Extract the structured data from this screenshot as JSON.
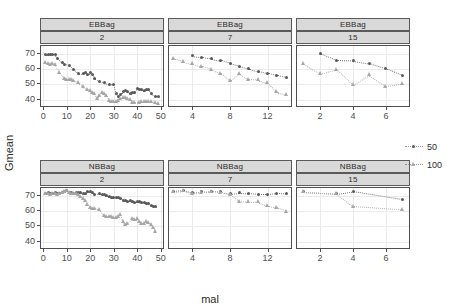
{
  "chart_data": {
    "type": "scatter",
    "title": "",
    "xlabel": "mal",
    "ylabel": "Gmean",
    "ylim": [
      36,
      75
    ],
    "yticks": [
      40,
      50,
      60,
      70
    ],
    "grid": true,
    "legend": {
      "position": "right",
      "entries": [
        {
          "label": "50",
          "marker": "circle",
          "color": "#595959"
        },
        {
          "label": "100",
          "marker": "triangle",
          "color": "#a6a6a6"
        }
      ]
    },
    "facets": {
      "row_labels": [
        "EBBag",
        "NBBag"
      ],
      "col_labels": [
        "2",
        "7",
        "15"
      ]
    },
    "panels": [
      {
        "row": "EBBag",
        "col": "2",
        "xlim": [
          -1,
          51
        ],
        "xticks": [
          0,
          10,
          20,
          30,
          40,
          50
        ],
        "series": [
          {
            "name": "50",
            "marker": "circle",
            "x": [
              1,
              2,
              3,
              4,
              5,
              6,
              8,
              9,
              11,
              13,
              15,
              17,
              18,
              19,
              20,
              21,
              22,
              24,
              26,
              28,
              30,
              31,
              32,
              33,
              34,
              35,
              36,
              37,
              38,
              39,
              40,
              41,
              42,
              43,
              44,
              45,
              46,
              48,
              49
            ],
            "y": [
              69.2,
              69.6,
              69.8,
              69.5,
              69.8,
              67.0,
              64.5,
              63.0,
              62.5,
              60.0,
              57.0,
              57.3,
              57.5,
              56.2,
              58.0,
              56.5,
              54.0,
              52.0,
              51.0,
              50.2,
              50.0,
              44.0,
              42.5,
              43.8,
              45.5,
              46.0,
              45.2,
              44.0,
              44.5,
              45.0,
              47.5,
              47.0,
              46.5,
              46.0,
              47.0,
              46.8,
              44.0,
              42.5,
              42.5
            ]
          },
          {
            "name": "100",
            "marker": "triangle",
            "x": [
              1,
              2,
              3,
              4,
              5,
              7,
              9,
              10,
              11,
              12,
              13,
              15,
              17,
              19,
              20,
              21,
              22,
              23,
              24,
              25,
              26,
              27,
              28,
              29,
              30,
              31,
              32,
              33,
              34,
              35,
              36,
              37,
              38,
              39,
              41,
              42,
              43,
              44,
              45,
              46,
              48,
              49
            ],
            "y": [
              64.0,
              63.5,
              63.2,
              63.8,
              63.0,
              58.0,
              54.0,
              53.5,
              53.5,
              53.0,
              52.8,
              51.0,
              48.5,
              47.0,
              46.0,
              45.0,
              44.0,
              41.0,
              43.0,
              44.5,
              44.0,
              43.0,
              39.5,
              39.0,
              39.2,
              39.0,
              39.5,
              41.0,
              41.5,
              41.5,
              41.0,
              40.0,
              38.5,
              38.5,
              38.5,
              38.8,
              39.0,
              39.0,
              38.8,
              39.0,
              38.0,
              37.8
            ]
          }
        ]
      },
      {
        "row": "EBBag",
        "col": "7",
        "xlim": [
          1.5,
          14.5
        ],
        "xticks": [
          4,
          8,
          12
        ],
        "series": [
          {
            "name": "50",
            "marker": "circle",
            "x": [
              4,
              5,
              6,
              7,
              8,
              9,
              10,
              11,
              12,
              13,
              14
            ],
            "y": [
              68.6,
              67.8,
              66.8,
              65.6,
              63.8,
              62.0,
              60.3,
              58.6,
              57.3,
              56.0,
              54.8
            ]
          },
          {
            "name": "100",
            "marker": "triangle",
            "x": [
              2,
              3,
              4,
              5,
              6,
              7,
              8,
              9,
              10,
              11,
              12,
              13,
              14
            ],
            "y": [
              67.0,
              64.8,
              63.4,
              61.8,
              60.0,
              57.2,
              52.4,
              57.0,
              53.5,
              53.2,
              51.0,
              45.4,
              43.4
            ]
          }
        ]
      },
      {
        "row": "EBBag",
        "col": "15",
        "xlim": [
          0.6,
          7.4
        ],
        "xticks": [
          2,
          4,
          6
        ],
        "series": [
          {
            "name": "50",
            "marker": "circle",
            "x": [
              2,
              3,
              4,
              5,
              6,
              7
            ],
            "y": [
              70.2,
              65.8,
              65.5,
              63.8,
              60.5,
              56.0
            ]
          },
          {
            "name": "100",
            "marker": "triangle",
            "x": [
              1,
              2,
              3,
              4,
              5,
              6,
              7
            ],
            "y": [
              63.4,
              57.0,
              60.0,
              49.8,
              56.2,
              49.0,
              50.5
            ]
          }
        ]
      },
      {
        "row": "NBBag",
        "col": "2",
        "xlim": [
          -1,
          51
        ],
        "xticks": [
          0,
          10,
          20,
          30,
          40,
          50
        ],
        "series": [
          {
            "name": "50",
            "marker": "circle",
            "x": [
              1,
              2,
              3,
              4,
              5,
              6,
              7,
              8,
              9,
              10,
              11,
              12,
              13,
              14,
              15,
              16,
              17,
              18,
              19,
              20,
              21,
              22,
              24,
              25,
              26,
              27,
              28,
              29,
              30,
              31,
              32,
              33,
              34,
              35,
              36,
              37,
              38,
              39,
              40,
              41,
              42,
              43,
              44,
              45,
              46,
              47,
              48
            ],
            "y": [
              71.6,
              71.8,
              71.2,
              71.5,
              71.8,
              71.2,
              71.5,
              72.2,
              72.8,
              73.2,
              72.4,
              71.8,
              71.5,
              72.0,
              71.8,
              72.0,
              71.2,
              71.6,
              72.6,
              73.0,
              72.0,
              71.0,
              71.2,
              70.8,
              70.5,
              70.0,
              69.5,
              68.8,
              69.0,
              69.0,
              68.6,
              68.2,
              67.0,
              66.8,
              66.5,
              66.8,
              66.0,
              65.8,
              66.2,
              66.0,
              65.8,
              65.4,
              65.0,
              64.8,
              63.4,
              63.2,
              62.8
            ]
          },
          {
            "name": "100",
            "marker": "triangle",
            "x": [
              1,
              2,
              3,
              4,
              5,
              6,
              7,
              8,
              9,
              10,
              11,
              12,
              13,
              14,
              15,
              16,
              17,
              18,
              19,
              20,
              21,
              22,
              24,
              26,
              27,
              28,
              29,
              30,
              31,
              32,
              33,
              34,
              35,
              36,
              38,
              39,
              40,
              41,
              42,
              43,
              44,
              45,
              46,
              47,
              48
            ],
            "y": [
              71.2,
              71.4,
              71.0,
              71.2,
              71.6,
              71.0,
              71.4,
              72.0,
              72.5,
              73.5,
              72.0,
              71.6,
              71.4,
              71.4,
              70.5,
              69.8,
              68.5,
              67.0,
              64.5,
              62.5,
              61.8,
              62.0,
              61.0,
              57.0,
              56.5,
              56.2,
              56.4,
              56.0,
              55.8,
              56.5,
              57.5,
              53.5,
              51.0,
              52.0,
              55.0,
              54.5,
              55.0,
              53.5,
              52.0,
              52.0,
              53.0,
              52.5,
              51.0,
              49.5,
              46.6
            ]
          }
        ]
      },
      {
        "row": "NBBag",
        "col": "7",
        "xlim": [
          1.5,
          14.5
        ],
        "xticks": [
          4,
          8,
          12
        ],
        "series": [
          {
            "name": "50",
            "marker": "circle",
            "x": [
              2,
              3,
              4,
              5,
              6,
              7,
              8,
              9,
              10,
              11,
              12,
              13,
              14
            ],
            "y": [
              72.8,
              73.4,
              71.8,
              72.6,
              73.0,
              72.6,
              71.2,
              71.8,
              71.6,
              71.0,
              71.0,
              71.6,
              71.4
            ]
          },
          {
            "name": "100",
            "marker": "triangle",
            "x": [
              2,
              3,
              4,
              5,
              6,
              7,
              8,
              9,
              10,
              11,
              12,
              13,
              14
            ],
            "y": [
              72.6,
              73.2,
              71.6,
              72.4,
              72.8,
              72.4,
              71.0,
              66.5,
              66.0,
              66.2,
              63.5,
              62.4,
              60.0
            ]
          }
        ]
      },
      {
        "row": "NBBag",
        "col": "15",
        "xlim": [
          0.6,
          7.4
        ],
        "xticks": [
          2,
          4,
          6
        ],
        "series": [
          {
            "name": "50",
            "marker": "circle",
            "x": [
              1,
              3,
              4,
              7
            ],
            "y": [
              72.6,
              71.4,
              73.0,
              67.8
            ]
          },
          {
            "name": "100",
            "marker": "triangle",
            "x": [
              1,
              3,
              4,
              7
            ],
            "y": [
              72.6,
              71.4,
              63.2,
              61.0
            ]
          }
        ]
      }
    ]
  }
}
